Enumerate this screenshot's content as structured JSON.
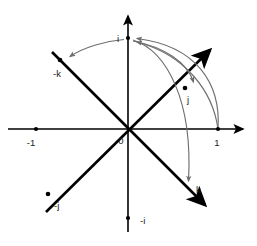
{
  "figure": {
    "type": "quaternion-rotation-diagram",
    "title": "",
    "background_color": "#ffffff"
  },
  "colors": {
    "axis": "#000000",
    "basis_vector": "#000000",
    "rotation_arc": "#6e6e6e",
    "label_text": "#1a1a1a"
  },
  "axes": [
    {
      "name": "real-axis",
      "orientation": "horizontal",
      "y": 129,
      "x_start": 8,
      "x_end": 243,
      "arrow_at": "right"
    },
    {
      "name": "imaginary-axis",
      "orientation": "vertical",
      "x": 128,
      "y_start": 232,
      "y_end": 16,
      "arrow_at": "top"
    }
  ],
  "diagonals": [
    {
      "name": "minus-k-to-k-diagonal",
      "from": {
        "x": 52,
        "y": 52
      },
      "to": {
        "x": 207,
        "y": 207
      },
      "arrow_at": "to"
    },
    {
      "name": "minus-j-to-j-diagonal",
      "from": {
        "x": 46,
        "y": 212
      },
      "to": {
        "x": 212,
        "y": 48
      },
      "arrow_at": "to"
    }
  ],
  "points": [
    {
      "id": "p-minus-one",
      "label": "-1",
      "x": 36,
      "y": 129,
      "label_dx": -5,
      "label_dy": 14
    },
    {
      "id": "p-one",
      "label": "1",
      "x": 218,
      "y": 129,
      "label_dx": -2,
      "label_dy": 15
    },
    {
      "id": "p-i",
      "label": "i",
      "x": 128,
      "y": 38,
      "label_dx": -12,
      "label_dy": 3
    },
    {
      "id": "p-minus-i",
      "label": "-i",
      "x": 128,
      "y": 218,
      "label_dx": 6,
      "label_dy": 5
    },
    {
      "id": "p-j",
      "label": "j",
      "x": 185,
      "y": 88,
      "label_dx": 2,
      "label_dy": 15
    },
    {
      "id": "p-minus-j",
      "label": "-j",
      "x": 48,
      "y": 194,
      "label_dx": 6,
      "label_dy": 14
    },
    {
      "id": "p-k",
      "label": "k",
      "x": 190,
      "y": 190,
      "label_dx": 7,
      "label_dy": 2
    },
    {
      "id": "p-minus-k",
      "label": "-k",
      "x": 60,
      "y": 60,
      "label_dx": -8,
      "label_dy": 16
    },
    {
      "id": "p-origin",
      "label": "0",
      "x": 128,
      "y": 129,
      "label_dx": -7,
      "label_dy": 14
    }
  ],
  "origin_label": "0",
  "rotation_arcs": [
    {
      "id": "arc-one-to-i",
      "name": "arc-from-1-to-i",
      "from_label": "1",
      "to_label": "i",
      "path": "M 218 129 C 220 84 196 47 136 39",
      "arrowhead_at": {
        "x": 136,
        "y": 39
      },
      "arrowhead_angle": -172
    },
    {
      "id": "arc-one-to-j",
      "name": "arc-from-1-to-j",
      "from_label": "1",
      "to_label": "i",
      "path": "M 218 129 C 214 92 186 56 136 42",
      "arrowhead_at": {
        "x": 136,
        "y": 42
      },
      "arrowhead_angle": -166
    },
    {
      "id": "arc-i-to-j",
      "name": "arc-from-i-to-j",
      "from_label": "i",
      "to_label": "j",
      "path": "M 132 41 C 163 47 186 62 193 83",
      "arrowhead_at": {
        "x": 192,
        "y": 84
      },
      "arrowhead_angle": 110
    },
    {
      "id": "arc-i-to-k",
      "name": "arc-from-i-to-k",
      "from_label": "i",
      "to_label": "k",
      "path": "M 132 40 C 166 50 192 100 188 182",
      "arrowhead_at": {
        "x": 188,
        "y": 184
      },
      "arrowhead_angle": 92
    },
    {
      "id": "arc-i-to-minus-k",
      "name": "arc-from-i-to-minus-k",
      "from_label": "i",
      "to_label": "-k",
      "path": "M 124 39 C 104 41 82 48 69 57",
      "arrowhead_at": {
        "x": 67,
        "y": 58
      },
      "arrowhead_angle": 205
    }
  ]
}
